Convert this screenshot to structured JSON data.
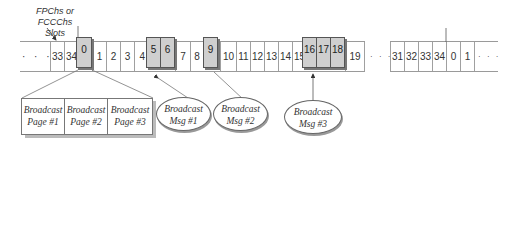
{
  "annotation": {
    "line1": "FPChs or",
    "line2": "FCCChs Slots"
  },
  "strip1": {
    "leading_ellipsis": "· · ·",
    "cells": [
      "33",
      "34",
      "0",
      "1",
      "2",
      "3",
      "4",
      "5",
      "6",
      "7",
      "8",
      "9",
      "10",
      "11",
      "12",
      "13",
      "14",
      "15",
      "16",
      "17",
      "18",
      "19"
    ],
    "highlighted": [
      "0",
      "5",
      "6",
      "9",
      "16",
      "17",
      "18"
    ],
    "trailing_ellipsis": "· · ·"
  },
  "strip2": {
    "cells": [
      "31",
      "32",
      "33",
      "34",
      "0",
      "1"
    ],
    "trailing_ellipsis": "· · ·"
  },
  "pages": [
    {
      "line1": "Broadcast",
      "line2": "Page #1"
    },
    {
      "line1": "Broadcast",
      "line2": "Page #2"
    },
    {
      "line1": "Broadcast",
      "line2": "Page #3"
    }
  ],
  "messages": [
    {
      "line1": "Broadcast",
      "line2": "Msg #1"
    },
    {
      "line1": "Broadcast",
      "line2": "Msg #2"
    },
    {
      "line1": "Broadcast",
      "line2": "Msg #3"
    }
  ],
  "colors": {
    "highlight_fill": "#cfcfcf",
    "line": "#9a9a9a"
  }
}
